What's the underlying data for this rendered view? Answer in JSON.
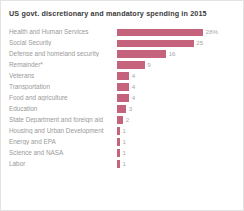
{
  "chart_data": {
    "type": "bar",
    "orientation": "horizontal",
    "title": "US govt. discretionary and mandatory spending in 2015",
    "xlabel": "",
    "ylabel": "",
    "unit": "percent",
    "grid": false,
    "legend": null,
    "xlim": [
      0,
      28
    ],
    "categories": [
      "Health and Human Services",
      "Social Security",
      "Defense and homeland security",
      "Remainder*",
      "Veterans",
      "Transportation",
      "Food and agriculture",
      "Education",
      "State Department and foreign aid",
      "Housing and Urban Development",
      "Energy and EPA",
      "Science and NASA",
      "Labor"
    ],
    "values": [
      28,
      25,
      16,
      9,
      4,
      4,
      4,
      3,
      2,
      1,
      1,
      1,
      1
    ],
    "value_labels": [
      "28%",
      "25",
      "16",
      "9",
      "4",
      "4",
      "4",
      "3",
      "2",
      "1",
      "1",
      "1",
      "1"
    ],
    "bar_color": "#c4637b",
    "label_color": "#9a9a9a",
    "title_color": "#3a3a3a",
    "background": "#ffffff",
    "border_color": "#e3e3e3"
  },
  "footnote": {
    "text": ""
  }
}
